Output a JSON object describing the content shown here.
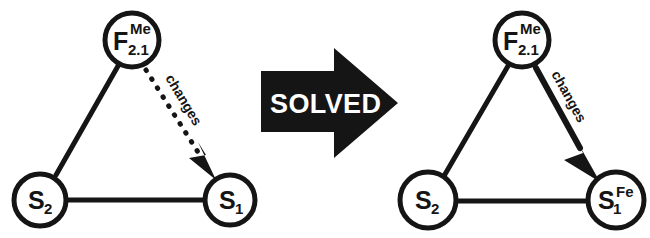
{
  "figure": {
    "background_color": "#ffffff",
    "ink_color": "#151515",
    "panels": [
      {
        "id": "before",
        "name": "unsolved-graph",
        "nodes": [
          {
            "id": "F",
            "main": "F",
            "sub": "2.1",
            "sup": "Me",
            "cx": 132,
            "cy": 40,
            "r": 29
          },
          {
            "id": "S2",
            "main": "S",
            "sub": "2",
            "sup": "",
            "cx": 40,
            "cy": 200,
            "r": 28
          },
          {
            "id": "S1",
            "main": "S",
            "sub": "1",
            "sup": "",
            "cx": 230,
            "cy": 200,
            "r": 27
          }
        ],
        "edges": [
          {
            "from": "F",
            "to": "S2",
            "style": "solid",
            "arrow": "none",
            "label": ""
          },
          {
            "from": "S2",
            "to": "S1",
            "style": "solid",
            "arrow": "none",
            "label": ""
          },
          {
            "from": "F",
            "to": "S1",
            "style": "dotted",
            "arrow": "arrowhead",
            "label": "changes"
          }
        ]
      },
      {
        "id": "after",
        "name": "solved-graph",
        "nodes": [
          {
            "id": "F",
            "main": "F",
            "sub": "2.1",
            "sup": "Me",
            "cx": 522,
            "cy": 40,
            "r": 29
          },
          {
            "id": "S2",
            "main": "S",
            "sub": "2",
            "sup": "",
            "cx": 428,
            "cy": 200,
            "r": 30
          },
          {
            "id": "S1",
            "main": "S",
            "sub": "1",
            "sup": "Fe",
            "cx": 616,
            "cy": 200,
            "r": 30
          }
        ],
        "edges": [
          {
            "from": "F",
            "to": "S2",
            "style": "solid",
            "arrow": "none",
            "label": ""
          },
          {
            "from": "S2",
            "to": "S1",
            "style": "solid",
            "arrow": "none",
            "label": ""
          },
          {
            "from": "F",
            "to": "S1",
            "style": "solid",
            "arrow": "arrowhead",
            "label": "changes"
          }
        ]
      }
    ],
    "transition": {
      "name": "solved-arrow",
      "label": "SOLVED",
      "direction": "right",
      "fill": "#151515",
      "text_color": "#ffffff"
    }
  }
}
